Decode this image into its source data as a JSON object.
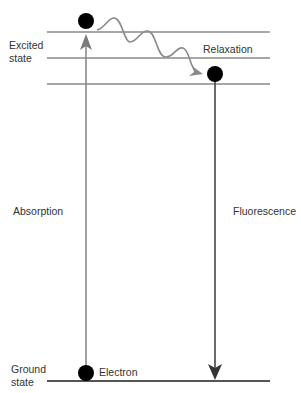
{
  "diagram": {
    "type": "jablonski-fluorescence",
    "labels": {
      "excited_state": "Excited state",
      "relaxation": "Relaxation",
      "absorption": "Absorption",
      "fluorescence": "Fluorescence",
      "ground_state": "Ground state",
      "electron": "Electron"
    },
    "colors": {
      "level_line": "#8a8a8a",
      "ground_line": "#555555",
      "absorption_arrow": "#8a8a8a",
      "fluorescence_arrow": "#444444",
      "relaxation_path": "#8a8a8a",
      "electron": "#000000",
      "text": "#333333"
    },
    "energy_levels": [
      {
        "name": "excited-level-1",
        "y": 32
      },
      {
        "name": "excited-level-2",
        "y": 58
      },
      {
        "name": "excited-level-3",
        "y": 84
      },
      {
        "name": "ground-level",
        "y": 381
      }
    ]
  }
}
